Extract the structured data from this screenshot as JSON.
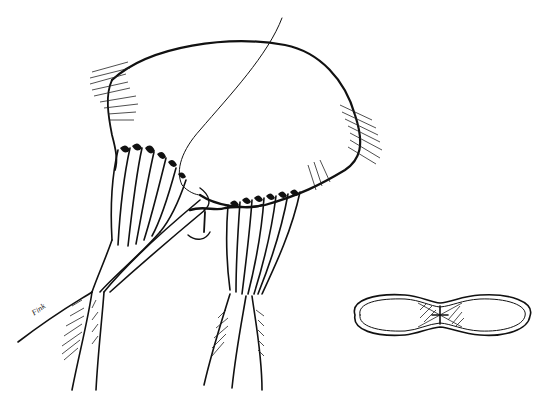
{
  "figure": {
    "signature": "Fink",
    "inset": {
      "subject": "valve orifice outline (figure-eight shape) with hatched commissural region"
    },
    "colors": {
      "ink": "#111111",
      "background": "#ffffff"
    }
  }
}
